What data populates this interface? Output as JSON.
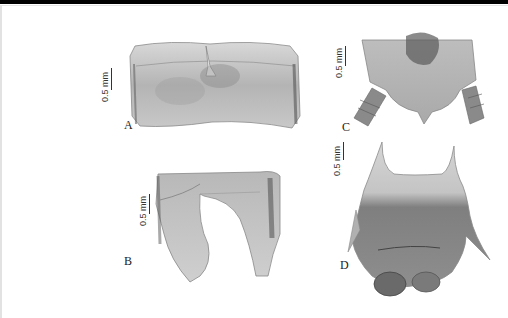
{
  "figure": {
    "panels": [
      {
        "id": "A",
        "label": "A",
        "scale_label": "0.5 mm",
        "description": "dorsal plate, rectangular sclerite with median notch"
      },
      {
        "id": "B",
        "label": "B",
        "scale_label": "0.5 mm",
        "description": "U-shaped sclerite with two lobes"
      },
      {
        "id": "C",
        "label": "C",
        "scale_label": "0.5 mm",
        "description": "terminal segment with cerci"
      },
      {
        "id": "D",
        "label": "D",
        "scale_label": "0.5 mm",
        "description": "plate with two horn-like processes"
      }
    ],
    "colors": {
      "background": "#ffffff",
      "topbar": "#000000",
      "specimen_light": "#d6d6d6",
      "specimen_mid": "#a8a8a8",
      "specimen_dark": "#5a5a5a"
    }
  }
}
